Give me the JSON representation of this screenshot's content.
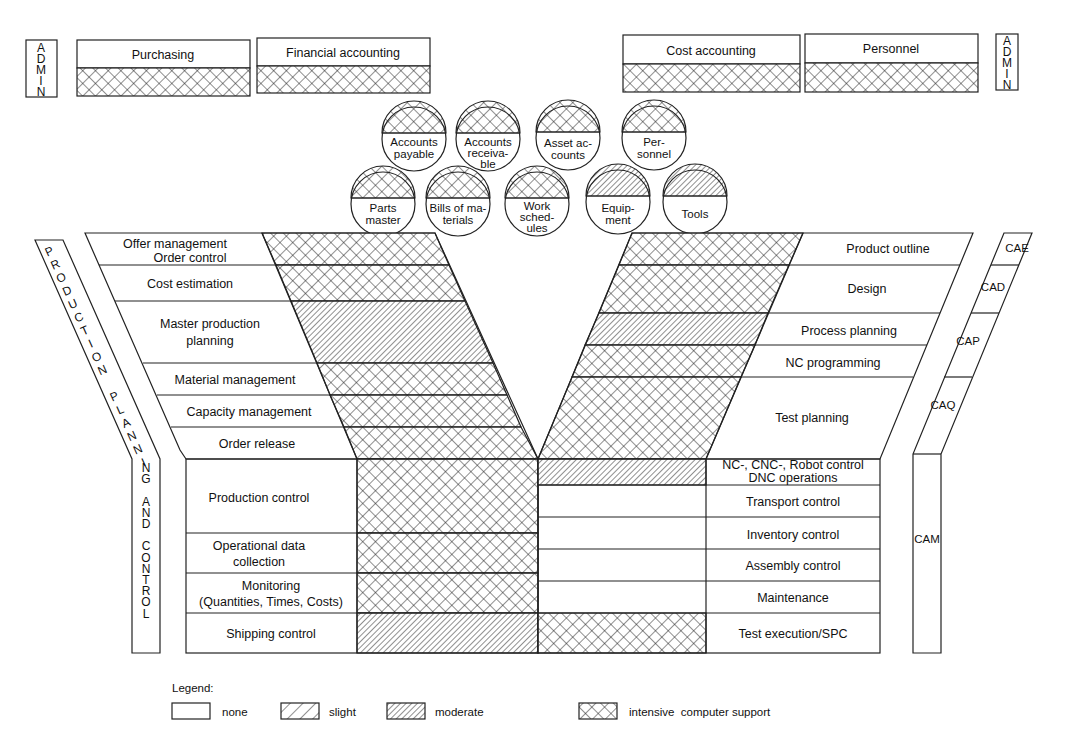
{
  "admin": {
    "left_label": "ADMIN",
    "right_label": "ADMIN",
    "left_boxes": [
      {
        "label": "Purchasing",
        "support": "intensive"
      },
      {
        "label": "Financial accounting",
        "support": "intensive"
      }
    ],
    "right_boxes": [
      {
        "label": "Cost accounting",
        "support": "intensive"
      },
      {
        "label": "Personnel",
        "support": "intensive"
      }
    ]
  },
  "databases": {
    "row1": [
      {
        "l1": "Accounts",
        "l2": "payable",
        "l3": "",
        "support": "intensive"
      },
      {
        "l1": "Accounts",
        "l2": "receiva-",
        "l3": "ble",
        "support": "intensive"
      },
      {
        "l1": "Asset ac-",
        "l2": "counts",
        "l3": "",
        "support": "intensive"
      },
      {
        "l1": "Per-",
        "l2": "sonnel",
        "l3": "",
        "support": "intensive"
      }
    ],
    "row2": [
      {
        "l1": "Parts",
        "l2": "master",
        "l3": "",
        "support": "intensive"
      },
      {
        "l1": "Bills of ma-",
        "l2": "terials",
        "l3": "",
        "support": "intensive"
      },
      {
        "l1": "Work",
        "l2": "sched-",
        "l3": "ules",
        "support": "intensive"
      },
      {
        "l1": "Equip-",
        "l2": "ment",
        "l3": "",
        "support": "moderate"
      },
      {
        "l1": "Tools",
        "l2": "",
        "l3": "",
        "support": "moderate"
      }
    ]
  },
  "ppc": {
    "side_label": "PRODUCTION PLANNING AND CONTROL",
    "upper_rows": [
      {
        "l1": "Offer management",
        "l2": "Order control",
        "support": "intensive"
      },
      {
        "l1": "Cost estimation",
        "l2": "",
        "support": "intensive"
      },
      {
        "l1": "Master production",
        "l2": "planning",
        "support": "moderate"
      },
      {
        "l1": "Material management",
        "l2": "",
        "support": "intensive"
      },
      {
        "l1": "Capacity management",
        "l2": "",
        "support": "intensive"
      },
      {
        "l1": "Order release",
        "l2": "",
        "support": "intensive"
      }
    ],
    "lower_rows": [
      {
        "l1": "Production control",
        "l2": "",
        "support": "intensive"
      },
      {
        "l1": "Operational data",
        "l2": "collection",
        "support": "intensive"
      },
      {
        "l1": "Monitoring",
        "l2": "(Quantities, Times, Costs)",
        "support": "intensive"
      },
      {
        "l1": "Shipping control",
        "l2": "",
        "support": "moderate"
      }
    ]
  },
  "cax": {
    "upper_rows": [
      {
        "l1": "Product outline",
        "support": "intensive"
      },
      {
        "l1": "Design",
        "support": "intensive"
      },
      {
        "l1": "Process planning",
        "support": "moderate"
      },
      {
        "l1": "NC programming",
        "support": "intensive"
      },
      {
        "l1": "Test planning",
        "support": "intensive"
      }
    ],
    "lower_rows": [
      {
        "l1": "NC-, CNC-, Robot control",
        "l2": "DNC operations",
        "support": "moderate"
      },
      {
        "l1": "Transport control",
        "l2": "",
        "support": "none"
      },
      {
        "l1": "Inventory control",
        "l2": "",
        "support": "none"
      },
      {
        "l1": "Assembly control",
        "l2": "",
        "support": "none"
      },
      {
        "l1": "Maintenance",
        "l2": "",
        "support": "none"
      },
      {
        "l1": "Test execution/SPC",
        "l2": "",
        "support": "intensive"
      }
    ],
    "side_labels": [
      "CAE",
      "CAD",
      "CAP",
      "CAQ",
      "CAM"
    ]
  },
  "legend": {
    "title": "Legend:",
    "items": [
      {
        "key": "none",
        "label": "none"
      },
      {
        "key": "slight",
        "label": "slight"
      },
      {
        "key": "moderate",
        "label": "moderate"
      },
      {
        "key": "intensive",
        "label": "intensive  computer support"
      }
    ]
  }
}
